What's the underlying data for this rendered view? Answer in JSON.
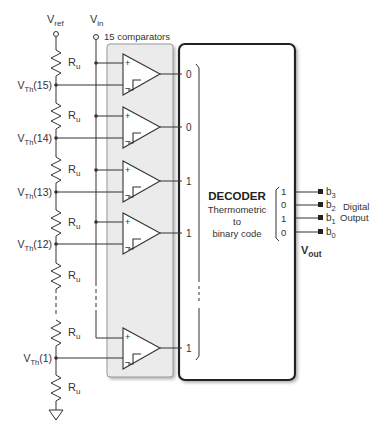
{
  "labels": {
    "vref": "V",
    "vref_sub": "ref",
    "vin": "V",
    "vin_sub": "in",
    "comparators_title": "15 comparators",
    "resistor": "R",
    "resistor_sub": "u"
  },
  "nodes": [
    {
      "label": "V",
      "sub": "Th",
      "suffix": "(15)"
    },
    {
      "label": "V",
      "sub": "Th",
      "suffix": "(14)"
    },
    {
      "label": "V",
      "sub": "Th",
      "suffix": "(13)"
    },
    {
      "label": "V",
      "sub": "Th",
      "suffix": "(12)"
    },
    {
      "label": "V",
      "sub": "Th",
      "suffix": "(1)"
    }
  ],
  "comparator_outputs": [
    "0",
    "0",
    "1",
    "1",
    "1"
  ],
  "decoder": {
    "title": "DECODER",
    "line1": "Thermometric",
    "line2": "to",
    "line3": "binary code"
  },
  "binary_code": [
    "1",
    "0",
    "1",
    "0"
  ],
  "outputs": [
    {
      "label": "b",
      "sub": "3"
    },
    {
      "label": "b",
      "sub": "2"
    },
    {
      "label": "b",
      "sub": "1"
    },
    {
      "label": "b",
      "sub": "0"
    }
  ],
  "digital_output": {
    "line1": "Digital",
    "line2": "Output"
  },
  "vout": {
    "label": "V",
    "sub": "out"
  },
  "colors": {
    "panel_fill": "#ebebeb",
    "line": "#333333",
    "box_border": "#222222"
  }
}
